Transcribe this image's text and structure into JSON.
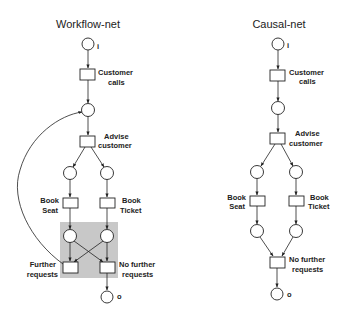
{
  "diagrams": [
    {
      "title": "Workflow-net",
      "labels": {
        "input_place": "i",
        "customer_calls_1": "Customer",
        "customer_calls_2": "calls",
        "advise_1": "Advise",
        "advise_2": "customer",
        "book_seat_1": "Book",
        "book_seat_2": "Seat",
        "book_ticket_1": "Book",
        "book_ticket_2": "Ticket",
        "further_1": "Further",
        "further_2": "requests",
        "no_further_1": "No further",
        "no_further_2": "requests",
        "output_place": "o"
      },
      "highlight_color": "#c8c8c8"
    },
    {
      "title": "Causal-net",
      "labels": {
        "input_place": "i",
        "customer_calls_1": "Customer",
        "customer_calls_2": "calls",
        "advise_1": "Advise",
        "advise_2": "customer",
        "book_seat_1": "Book",
        "book_seat_2": "Seat",
        "book_ticket_1": "Book",
        "book_ticket_2": "Ticket",
        "no_further_1": "No further",
        "no_further_2": "requests",
        "output_place": "o"
      }
    }
  ]
}
